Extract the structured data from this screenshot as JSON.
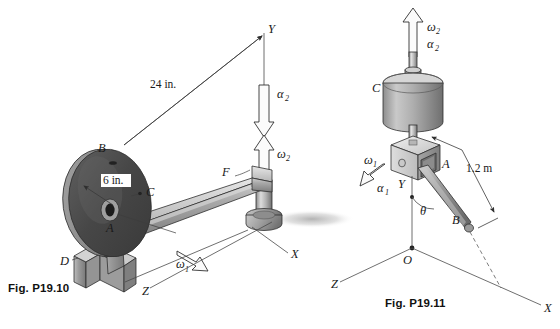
{
  "page": {
    "background_color": "#ffffff",
    "width": 560,
    "height": 329
  },
  "figures": [
    {
      "id": "fig-p19-10",
      "caption": "Fig. P19.10",
      "units": "inches",
      "dimensions": [
        {
          "name": "arm-length",
          "value": "24 in."
        },
        {
          "name": "disc-radius",
          "value": "6 in."
        }
      ],
      "point_labels": [
        {
          "name": "B",
          "text": "B"
        },
        {
          "name": "C",
          "text": "C"
        },
        {
          "name": "A",
          "text": "A"
        },
        {
          "name": "D",
          "text": "D"
        },
        {
          "name": "F",
          "text": "F"
        }
      ],
      "axes": [
        {
          "name": "Y",
          "text": "Y"
        },
        {
          "name": "X",
          "text": "X"
        },
        {
          "name": "Z",
          "text": "Z"
        }
      ],
      "vectors": [
        {
          "name": "alpha-2",
          "symbol": "α",
          "subscript": "2",
          "direction": "down"
        },
        {
          "name": "omega-2",
          "symbol": "ω",
          "subscript": "2",
          "direction": "up"
        },
        {
          "name": "omega-1",
          "symbol": "ω",
          "subscript": "1",
          "direction": "down-right"
        }
      ]
    },
    {
      "id": "fig-p19-11",
      "caption": "Fig. P19.11",
      "units": "meters",
      "dimensions": [
        {
          "name": "rod-length",
          "value": "1.2 m"
        }
      ],
      "point_labels": [
        {
          "name": "C",
          "text": "C"
        },
        {
          "name": "A",
          "text": "A"
        },
        {
          "name": "B",
          "text": "B"
        },
        {
          "name": "O",
          "text": "O"
        }
      ],
      "axes": [
        {
          "name": "Y",
          "text": "Y"
        },
        {
          "name": "X",
          "text": "X"
        },
        {
          "name": "Z",
          "text": "Z"
        }
      ],
      "angle_label": {
        "name": "theta",
        "text": "θ"
      },
      "vectors": [
        {
          "name": "omega-2",
          "symbol": "ω",
          "subscript": "2",
          "direction": "up"
        },
        {
          "name": "alpha-2",
          "symbol": "α",
          "subscript": "2",
          "direction": "up"
        },
        {
          "name": "omega-1",
          "symbol": "ω",
          "subscript": "1",
          "direction": "down-left"
        },
        {
          "name": "alpha-1",
          "symbol": "α",
          "subscript": "1",
          "direction": "down-left"
        }
      ]
    }
  ],
  "colors": {
    "ink": "#1a1a1a",
    "caption": "#111111",
    "disc_dark": "#4a4a4a",
    "disc_rim": "#8f8f8f",
    "metal_light": "#d4d4d4",
    "metal_mid": "#a8a8a8",
    "metal_dark": "#6e6e6e",
    "arrow_fill": "#fbfbfb",
    "line": "#3a3a3a",
    "shadow": "#b9b9b9"
  }
}
